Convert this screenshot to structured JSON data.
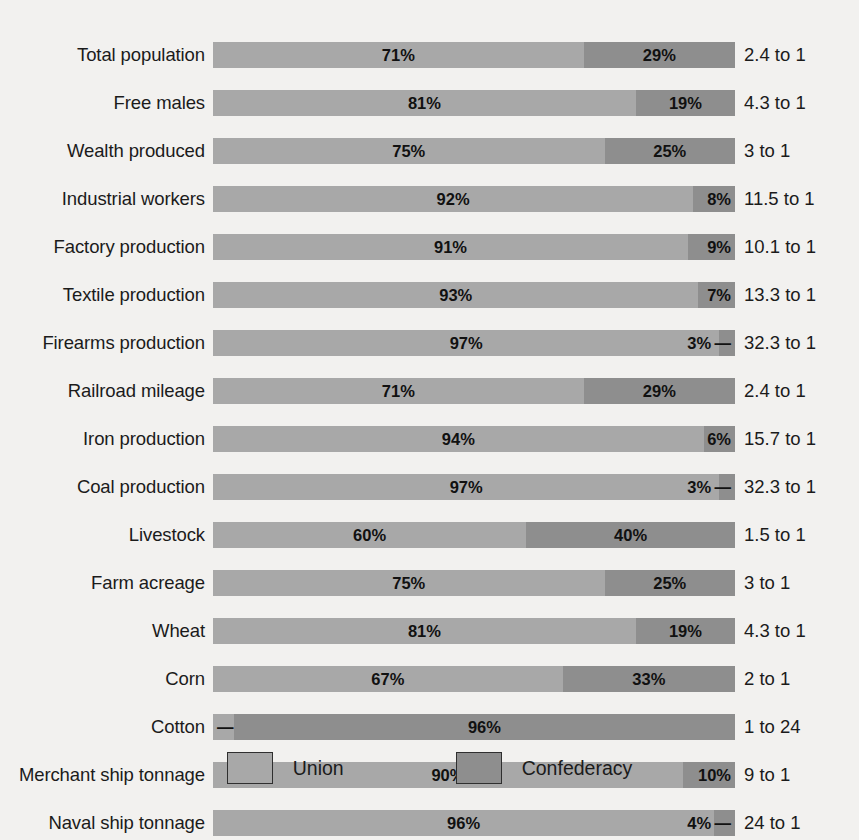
{
  "chart_data": {
    "type": "bar",
    "subtype": "stacked-horizontal-100-percent",
    "title": "",
    "xlabel": "",
    "ylabel": "",
    "xlim": [
      0,
      100
    ],
    "grid": false,
    "legend_position": "bottom-center",
    "categories": [
      "Total population",
      "Free males",
      "Wealth produced",
      "Industrial workers",
      "Factory production",
      "Textile production",
      "Firearms production",
      "Railroad mileage",
      "Iron production",
      "Coal production",
      "Livestock",
      "Farm acreage",
      "Wheat",
      "Corn",
      "Cotton",
      "Merchant ship tonnage",
      "Naval ship tonnage"
    ],
    "series": [
      {
        "name": "Union",
        "color": "#a8a8a8",
        "values": [
          71,
          81,
          75,
          92,
          91,
          93,
          97,
          71,
          94,
          97,
          60,
          75,
          81,
          67,
          4,
          90,
          96
        ]
      },
      {
        "name": "Confederacy",
        "color": "#8e8e8e",
        "values": [
          29,
          19,
          25,
          8,
          9,
          7,
          3,
          29,
          6,
          3,
          40,
          25,
          19,
          33,
          96,
          10,
          4
        ]
      }
    ],
    "ratios": [
      "2.4 to 1",
      "4.3 to 1",
      "3 to 1",
      "11.5 to 1",
      "10.1 to 1",
      "13.3 to 1",
      "32.3 to 1",
      "2.4 to 1",
      "15.7 to 1",
      "32.3 to 1",
      "1.5 to 1",
      "3 to 1",
      "4.3 to 1",
      "2 to 1",
      "1 to 24",
      "9 to 1",
      "24 to 1"
    ]
  },
  "rows": [
    {
      "label": "Total population",
      "union": 71,
      "conf": 29,
      "union_label": "71%",
      "conf_label": "29%",
      "ratio": "2.4 to 1"
    },
    {
      "label": "Free males",
      "union": 81,
      "conf": 19,
      "union_label": "81%",
      "conf_label": "19%",
      "ratio": "4.3 to 1"
    },
    {
      "label": "Wealth produced",
      "union": 75,
      "conf": 25,
      "union_label": "75%",
      "conf_label": "25%",
      "ratio": "3 to 1"
    },
    {
      "label": "Industrial workers",
      "union": 92,
      "conf": 8,
      "union_label": "92%",
      "conf_label": "8%",
      "ratio": "11.5 to 1"
    },
    {
      "label": "Factory production",
      "union": 91,
      "conf": 9,
      "union_label": "91%",
      "conf_label": "9%",
      "ratio": "10.1 to 1"
    },
    {
      "label": "Textile production",
      "union": 93,
      "conf": 7,
      "union_label": "93%",
      "conf_label": "7%",
      "ratio": "13.3 to 1"
    },
    {
      "label": "Firearms production",
      "union": 97,
      "conf": 3,
      "union_label": "97%",
      "conf_label": "3% —",
      "ratio": "32.3 to 1"
    },
    {
      "label": "Railroad mileage",
      "union": 71,
      "conf": 29,
      "union_label": "71%",
      "conf_label": "29%",
      "ratio": "2.4 to 1"
    },
    {
      "label": "Iron production",
      "union": 94,
      "conf": 6,
      "union_label": "94%",
      "conf_label": "6%",
      "ratio": "15.7 to 1"
    },
    {
      "label": "Coal production",
      "union": 97,
      "conf": 3,
      "union_label": "97%",
      "conf_label": "3% —",
      "ratio": "32.3 to 1"
    },
    {
      "label": "Livestock",
      "union": 60,
      "conf": 40,
      "union_label": "60%",
      "conf_label": "40%",
      "ratio": "1.5 to 1"
    },
    {
      "label": "Farm acreage",
      "union": 75,
      "conf": 25,
      "union_label": "75%",
      "conf_label": "25%",
      "ratio": "3 to 1"
    },
    {
      "label": "Wheat",
      "union": 81,
      "conf": 19,
      "union_label": "81%",
      "conf_label": "19%",
      "ratio": "4.3 to 1"
    },
    {
      "label": "Corn",
      "union": 67,
      "conf": 33,
      "union_label": "67%",
      "conf_label": "33%",
      "ratio": "2 to 1"
    },
    {
      "label": "Cotton",
      "union": 4,
      "conf": 96,
      "union_label": "— 4%",
      "conf_label": "96%",
      "ratio": "1 to 24"
    },
    {
      "label": "Merchant ship tonnage",
      "union": 90,
      "conf": 10,
      "union_label": "90%",
      "conf_label": "10%",
      "ratio": "9 to 1"
    },
    {
      "label": "Naval ship tonnage",
      "union": 96,
      "conf": 4,
      "union_label": "96%",
      "conf_label": "4% —",
      "ratio": "24 to 1"
    }
  ],
  "legend": {
    "items": [
      {
        "label": "Union",
        "color": "#a8a8a8"
      },
      {
        "label": "Confederacy",
        "color": "#8e8e8e"
      }
    ]
  }
}
